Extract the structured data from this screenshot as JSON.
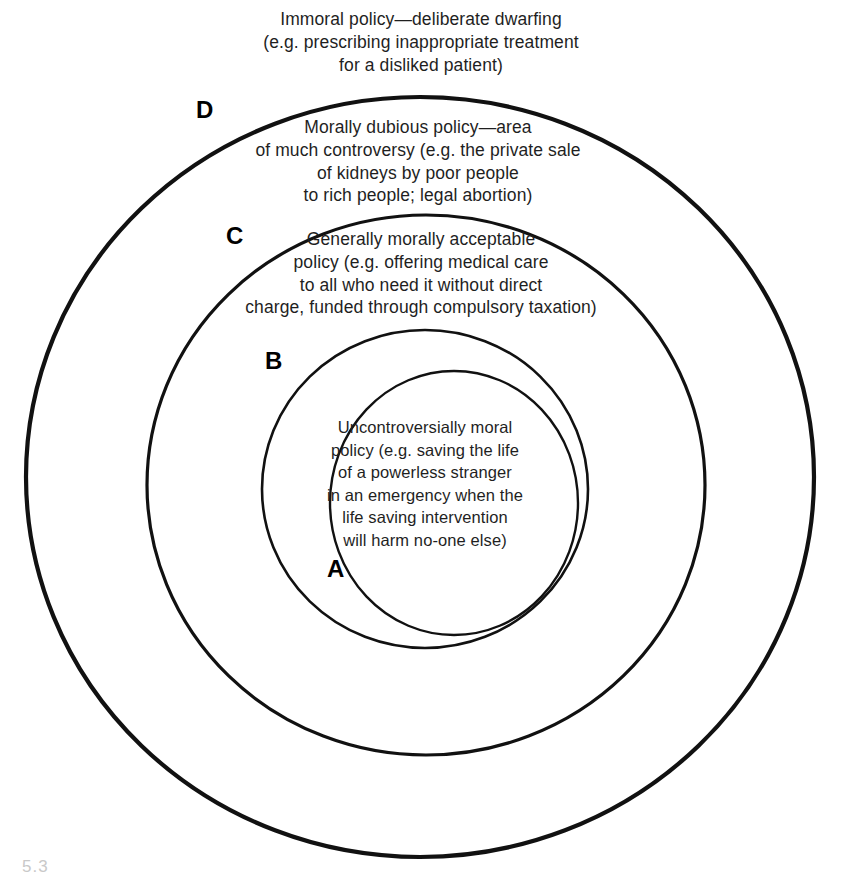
{
  "figure": {
    "type": "concentric-circles-diagram",
    "background_color": "#ffffff",
    "line_color": "#111111",
    "text_color": "#1f1f1f",
    "caption_stub": "5.3"
  },
  "zones": [
    {
      "letter": "A",
      "name": "innermost-zone",
      "text": "Uncontroversially moral\npolicy (e.g. saving the life\nof a powerless stranger\nin an emergency when the\nlife saving intervention\nwill harm no-one else)"
    },
    {
      "letter": "B",
      "name": "second-zone",
      "text": "Generally morally acceptable\npolicy (e.g. offering medical care\nto all who need it without direct\ncharge, funded through compulsory taxation)"
    },
    {
      "letter": "C",
      "name": "third-zone",
      "text": "Morally dubious policy—area\nof much controversy (e.g. the private sale\nof kidneys by poor people\nto rich people; legal abortion)"
    },
    {
      "letter": "D",
      "name": "outer-zone",
      "text": "Immoral policy—deliberate dwarfing\n(e.g. prescribing inappropriate treatment\nfor a disliked patient)"
    }
  ],
  "circles": [
    {
      "name": "outer-circle",
      "cx": 420,
      "cy": 477,
      "rx": 394,
      "ry": 380,
      "stroke_width": 4.2
    },
    {
      "name": "third-circle",
      "cx": 426,
      "cy": 485,
      "rx": 279,
      "ry": 270,
      "stroke_width": 3.2
    },
    {
      "name": "second-circle",
      "cx": 425,
      "cy": 489,
      "rx": 163,
      "ry": 159,
      "stroke_width": 2.6
    },
    {
      "name": "inner-circle",
      "cx": 454,
      "cy": 503,
      "rx": 124,
      "ry": 132,
      "stroke_width": 2.4
    }
  ]
}
